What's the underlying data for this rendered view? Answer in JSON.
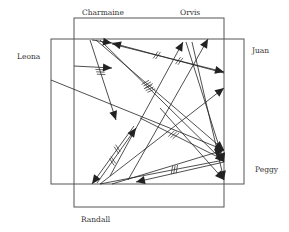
{
  "diagram": {
    "type": "sociogram",
    "colors": {
      "line": "#222222",
      "box": "#555555",
      "text": "#333333",
      "background": "#ffffff"
    },
    "boxes": [
      {
        "id": "inner",
        "x": 74,
        "y": 18,
        "w": 150,
        "h": 189
      },
      {
        "id": "outer",
        "x": 51,
        "y": 39,
        "w": 193,
        "h": 145
      }
    ],
    "labels": [
      {
        "id": "charmaine",
        "text": "Charmaine",
        "x": 82,
        "y": 8
      },
      {
        "id": "orvis",
        "text": "Orvis",
        "x": 180,
        "y": 8
      },
      {
        "id": "leona",
        "text": "Leona",
        "x": 17,
        "y": 52
      },
      {
        "id": "juan",
        "text": "Juan",
        "x": 252,
        "y": 46
      },
      {
        "id": "peggy",
        "text": "Peggy",
        "x": 255,
        "y": 165
      },
      {
        "id": "randall",
        "text": "Randall",
        "x": 81,
        "y": 215
      }
    ],
    "nodes": {
      "charmaine_pt": {
        "x": 100,
        "y": 41
      },
      "orvis_pt1": {
        "x": 183,
        "y": 42
      },
      "orvis_pt2": {
        "x": 208,
        "y": 39
      },
      "leona_pt": {
        "x": 74,
        "y": 66
      },
      "juan_pt": {
        "x": 224,
        "y": 73
      },
      "juan_pt2": {
        "x": 224,
        "y": 88
      },
      "peggy_pt1": {
        "x": 223,
        "y": 149
      },
      "peggy_pt2": {
        "x": 223,
        "y": 161
      },
      "peggy_pt3": {
        "x": 223,
        "y": 180
      },
      "randall_pt1": {
        "x": 92,
        "y": 184
      },
      "randall_pt2": {
        "x": 100,
        "y": 184
      },
      "randall_pt3": {
        "x": 112,
        "y": 184
      },
      "randall_pt4": {
        "x": 140,
        "y": 182
      }
    },
    "edges": [
      {
        "from": [
          92,
          40
        ],
        "to": [
          112,
          43
        ],
        "arrow": true,
        "ticks": 0
      },
      {
        "from": [
          224,
          73
        ],
        "to": [
          112,
          43
        ],
        "arrow": true,
        "ticks": 2
      },
      {
        "from": [
          74,
          66
        ],
        "to": [
          112,
          68
        ],
        "arrow": true,
        "ticks": 0
      },
      {
        "from": [
          90,
          40
        ],
        "to": [
          116,
          120
        ],
        "arrow": true,
        "ticks": 3
      },
      {
        "from": [
          96,
          40
        ],
        "to": [
          224,
          150
        ],
        "arrow": true,
        "ticks": 3
      },
      {
        "from": [
          100,
          40
        ],
        "to": [
          224,
          162
        ],
        "arrow": true,
        "ticks": 3
      },
      {
        "from": [
          112,
          44
        ],
        "to": [
          224,
          72
        ],
        "arrow": true,
        "ticks": 2
      },
      {
        "from": [
          51,
          80
        ],
        "to": [
          224,
          150
        ],
        "arrow": true,
        "ticks": 0
      },
      {
        "from": [
          110,
          176
        ],
        "to": [
          183,
          42
        ],
        "arrow": true,
        "ticks": 0
      },
      {
        "from": [
          128,
          180
        ],
        "to": [
          208,
          39
        ],
        "arrow": true,
        "ticks": 0
      },
      {
        "from": [
          186,
          42
        ],
        "to": [
          224,
          162
        ],
        "arrow": true,
        "ticks": 0
      },
      {
        "from": [
          192,
          42
        ],
        "to": [
          224,
          180
        ],
        "arrow": true,
        "ticks": 0
      },
      {
        "from": [
          97,
          183
        ],
        "to": [
          136,
          128
        ],
        "arrow": true,
        "ticks": 2
      },
      {
        "from": [
          134,
          126
        ],
        "to": [
          92,
          184
        ],
        "arrow": true,
        "ticks": 2
      },
      {
        "from": [
          100,
          184
        ],
        "to": [
          224,
          88
        ],
        "arrow": true,
        "ticks": 0
      },
      {
        "from": [
          112,
          184
        ],
        "to": [
          224,
          150
        ],
        "arrow": true,
        "ticks": 0
      },
      {
        "from": [
          224,
          160
        ],
        "to": [
          100,
          184
        ],
        "arrow": false,
        "ticks": 3
      },
      {
        "from": [
          224,
          162
        ],
        "to": [
          136,
          182
        ],
        "arrow": true,
        "ticks": 0
      },
      {
        "from": [
          140,
          118
        ],
        "to": [
          224,
          160
        ],
        "arrow": false,
        "ticks": 3
      },
      {
        "from": [
          160,
          108
        ],
        "to": [
          224,
          180
        ],
        "arrow": true,
        "ticks": 0
      }
    ]
  }
}
